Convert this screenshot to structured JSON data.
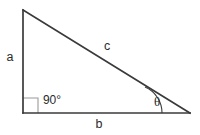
{
  "figure": {
    "kind": "right-triangle-diagram",
    "background_color": "#ffffff",
    "stroke_color": "#3a3a3a",
    "right_angle_box_color": "#9a9a9a",
    "text_color": "#2b2b2b"
  },
  "vertices": {
    "top_left": {
      "x": 23,
      "y": 10
    },
    "bottom_left": {
      "x": 23,
      "y": 113
    },
    "bottom_right": {
      "x": 190,
      "y": 113
    }
  },
  "sides": {
    "vertical_leg": {
      "label": "a",
      "label_x": 10,
      "label_y": 58,
      "x1": 23,
      "y1": 10,
      "x2": 23,
      "y2": 113
    },
    "horizontal_leg": {
      "label": "b",
      "label_x": 99,
      "label_y": 125,
      "x1": 23,
      "y1": 113,
      "x2": 190,
      "y2": 113
    },
    "hypotenuse": {
      "label": "c",
      "label_x": 107,
      "label_y": 47,
      "x1": 23,
      "y1": 10,
      "x2": 190,
      "y2": 113
    }
  },
  "angles": {
    "right_angle": {
      "label": "90°",
      "label_x": 52,
      "label_y": 101,
      "marker_x": 23,
      "marker_y": 98,
      "marker_size": 15
    },
    "theta_angle": {
      "label": "θ",
      "label_x": 157,
      "label_y": 103,
      "arc_path": "M 162 113 A 28 28 0 0 0 145 87",
      "vertex_x": 190,
      "vertex_y": 113
    }
  }
}
